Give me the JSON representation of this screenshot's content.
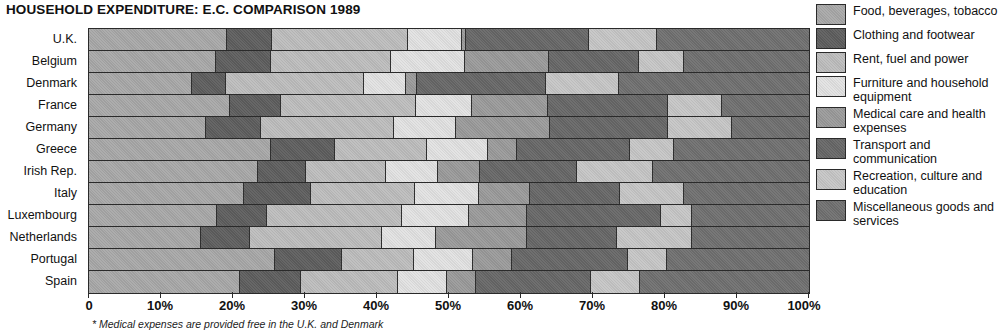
{
  "chart_data": {
    "type": "bar",
    "orientation": "horizontal",
    "stacked": true,
    "normalized": true,
    "title": "HOUSEHOLD EXPENDITURE: E.C. COMPARISON  1989",
    "xlabel": "",
    "ylabel": "",
    "xlim": [
      0,
      100
    ],
    "grid": false,
    "legend_position": "right",
    "footnote": "* Medical expenses are provided free in the U.K. and Denmark",
    "x_ticks": [
      "0",
      "10%",
      "20%",
      "30%",
      "40%",
      "50%",
      "60%",
      "70%",
      "80%",
      "90%",
      "100%"
    ],
    "x_tick_values": [
      0,
      10,
      20,
      30,
      40,
      50,
      60,
      70,
      80,
      90,
      100
    ],
    "categories": [
      "U.K.",
      "Belgium",
      "Denmark",
      "France",
      "Germany",
      "Greece",
      "Irish Rep.",
      "Italy",
      "Luxembourg",
      "Netherlands",
      "Portugal",
      "Spain"
    ],
    "series": [
      {
        "name": "Food, beverages, tobacco",
        "color": "#a8a8a8",
        "values": [
          19.2,
          17.6,
          14.3,
          19.6,
          16.2,
          25.3,
          23.5,
          21.5,
          17.8,
          15.5,
          25.8,
          21.0
        ]
      },
      {
        "name": "Clothing and footwear",
        "color": "#5e5e5e",
        "values": [
          6.2,
          7.7,
          4.7,
          7.0,
          7.7,
          8.8,
          6.6,
          9.4,
          6.9,
          6.9,
          9.4,
          8.4
        ]
      },
      {
        "name": "Rent, fuel and power",
        "color": "#bdbdbd",
        "values": [
          18.9,
          16.6,
          19.2,
          18.8,
          18.5,
          12.9,
          11.2,
          14.4,
          18.8,
          18.3,
          9.9,
          13.5
        ]
      },
      {
        "name": "Furniture and household equipment",
        "color": "#e2e2e2",
        "values": [
          7.5,
          10.3,
          5.8,
          7.8,
          8.6,
          8.4,
          7.2,
          8.9,
          9.3,
          7.5,
          8.3,
          6.8
        ]
      },
      {
        "name": "Medical care and health expenses",
        "color": "#9a9a9a",
        "values": [
          0.6,
          11.7,
          1.6,
          10.6,
          13.0,
          4.1,
          5.8,
          7.1,
          8.0,
          12.7,
          5.3,
          4.0
        ]
      },
      {
        "name": "Transport and communication",
        "color": "#676767",
        "values": [
          17.0,
          12.5,
          17.9,
          16.6,
          16.4,
          15.6,
          13.5,
          12.5,
          18.6,
          12.5,
          16.1,
          16.0
        ]
      },
      {
        "name": "Recreation, culture and education",
        "color": "#c6c6c6",
        "values": [
          9.5,
          6.2,
          10.1,
          7.5,
          8.9,
          6.1,
          10.6,
          8.8,
          4.4,
          10.3,
          5.5,
          6.9
        ]
      },
      {
        "name": "Miscellaneous goods and services",
        "color": "#707070",
        "values": [
          21.1,
          17.4,
          26.4,
          12.1,
          10.7,
          18.8,
          21.6,
          17.4,
          16.2,
          16.3,
          19.7,
          23.4
        ]
      }
    ]
  }
}
